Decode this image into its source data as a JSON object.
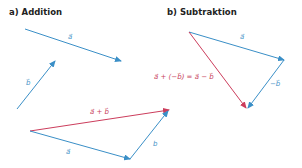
{
  "panels": {
    "addition": {
      "title": "a) Addition",
      "labels": {
        "a_top": "a⃗",
        "b_left": "b⃗",
        "sum": "a⃗ + b⃗",
        "a_bottom": "a⃗",
        "b_bottom": "b"
      }
    },
    "subtraction": {
      "title": "b) Subtraktion",
      "labels": {
        "a": "a⃗",
        "minus_b": "−b⃗",
        "equation": "a⃗ + (−b⃗) = a⃗ − b⃗"
      }
    }
  },
  "colors": {
    "vector": "#3a8fc7",
    "result": "#cc3d5c",
    "title": "#222222"
  }
}
